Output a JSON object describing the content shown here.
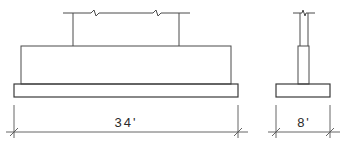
{
  "drawing": {
    "type": "footing elevation and section",
    "elevation": {
      "dimension_label": "34'"
    },
    "section": {
      "dimension_label": "8'"
    },
    "colors": {
      "line": "#4a4a4a",
      "background": "#ffffff",
      "text": "#2a2a2a"
    }
  }
}
